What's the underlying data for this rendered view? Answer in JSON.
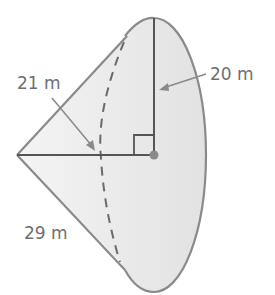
{
  "figure": {
    "type": "oblique cone",
    "labels": {
      "radius": "20 m",
      "height": "21 m",
      "slant": "29 m"
    },
    "colors": {
      "fill": "#e4e4e4",
      "outline": "#8a8a8a",
      "inner_lines": "#555555",
      "label": "#6f6f6f",
      "center_dot": "#8a8a8a"
    }
  }
}
